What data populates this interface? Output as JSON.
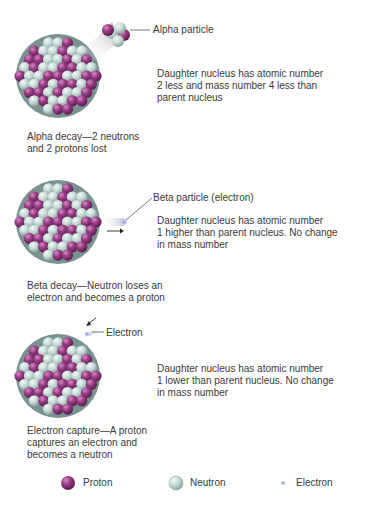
{
  "colors": {
    "proton": "#9b3f86",
    "proton_dark": "#6e2160",
    "neutron": "#c9dcd8",
    "neutron_dark": "#8ea6a2",
    "electron": "#a9b3e6",
    "text": "#3a3a3a",
    "background": "#ffffff"
  },
  "sections": [
    {
      "id": "alpha",
      "particle_label": "Alpha particle",
      "description": [
        "Daughter nucleus has atomic number",
        "2 less and mass number 4 less than",
        "parent nucleus"
      ],
      "caption": [
        "Alpha decay—2 neutrons",
        "and 2 protons lost"
      ]
    },
    {
      "id": "beta",
      "particle_label": "Beta particle (electron)",
      "description": [
        "Daughter nucleus has atomic number",
        "1 higher than parent nucleus. No change",
        "in mass number"
      ],
      "caption": [
        "Beta decay—Neutron loses an",
        "electron and becomes a proton"
      ]
    },
    {
      "id": "capture",
      "particle_label": "Electron",
      "description": [
        "Daughter nucleus has atomic number",
        "1 lower than parent nucleus. No change",
        "in mass number"
      ],
      "caption": [
        "Electron capture—A proton",
        "captures an electron and",
        "becomes a neutron"
      ]
    }
  ],
  "legend": [
    {
      "icon": "proton-icon",
      "label": "Proton"
    },
    {
      "icon": "neutron-icon",
      "label": "Neutron"
    },
    {
      "icon": "electron-icon",
      "label": "Electron"
    }
  ]
}
